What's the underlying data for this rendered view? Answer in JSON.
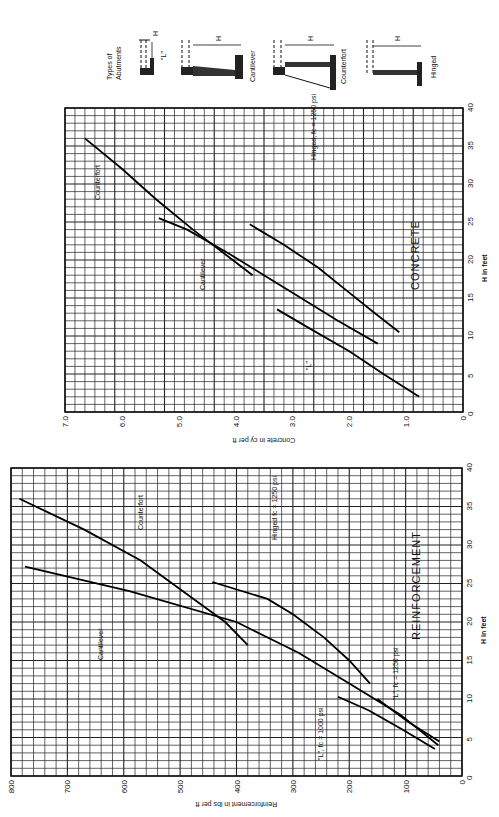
{
  "page": {
    "header_faint": "",
    "legend": {
      "title_line1": "Types of",
      "title_line2": "Abutments",
      "types": [
        {
          "key": "L",
          "label": "\"L\""
        },
        {
          "key": "cantilever",
          "label": "Cantilever"
        },
        {
          "key": "counterfort",
          "label": "Counterfort"
        },
        {
          "key": "hinged",
          "label": "Hinged"
        }
      ],
      "dimension_label": "H"
    }
  },
  "chart_data": [
    {
      "id": "concrete",
      "type": "line",
      "orientation": "rotated-90-ccw",
      "title": "CONCRETE",
      "xlabel": "H in feet",
      "ylabel": "Concrete in cy per ft",
      "xlim": [
        0,
        40
      ],
      "ylim": [
        0,
        7.0
      ],
      "xticks": [
        0,
        5,
        10,
        15,
        20,
        25,
        30,
        35,
        40
      ],
      "yticks": [
        0,
        1.0,
        2.0,
        3.0,
        4.0,
        5.0,
        6.0,
        7.0
      ],
      "ytick_labels": [
        "0",
        "1.0",
        "2.0",
        "3.0",
        "4.0",
        "5.0",
        "6.0",
        "7.0"
      ],
      "grid": true,
      "series": [
        {
          "name": "Counterfort",
          "label": "Counterfort",
          "points": [
            [
              18,
              3.7
            ],
            [
              20,
              4.05
            ],
            [
              24,
              4.75
            ],
            [
              28,
              5.4
            ],
            [
              32,
              6.0
            ],
            [
              36,
              6.65
            ]
          ]
        },
        {
          "name": "Cantilever",
          "label": "Cantilever",
          "points": [
            [
              9,
              1.5
            ],
            [
              12,
              2.2
            ],
            [
              15,
              2.85
            ],
            [
              18,
              3.5
            ],
            [
              21,
              4.15
            ],
            [
              24,
              4.85
            ],
            [
              25.5,
              5.35
            ]
          ]
        },
        {
          "name": "Hinged, fc = 1250 psi",
          "label": "Hinged, fc = 1250 psi",
          "points": [
            [
              10.5,
              1.12
            ],
            [
              13,
              1.55
            ],
            [
              16,
              2.05
            ],
            [
              19,
              2.55
            ],
            [
              22,
              3.15
            ],
            [
              24.7,
              3.75
            ]
          ]
        },
        {
          "name": "\"L\"",
          "label": "\"L\"",
          "points": [
            [
              2,
              0.77
            ],
            [
              5,
              1.4
            ],
            [
              8,
              2.0
            ],
            [
              11,
              2.7
            ],
            [
              13.5,
              3.27
            ]
          ]
        }
      ]
    },
    {
      "id": "reinforcement",
      "type": "line",
      "orientation": "rotated-90-ccw",
      "title": "REINFORCEMENT",
      "xlabel": "H in feet",
      "ylabel": "Reinforcement in lbs per ft",
      "xlim": [
        0,
        40
      ],
      "ylim": [
        0,
        800
      ],
      "xticks": [
        0,
        5,
        10,
        15,
        20,
        25,
        30,
        35,
        40
      ],
      "yticks": [
        0,
        100,
        200,
        300,
        400,
        500,
        600,
        700,
        800
      ],
      "ytick_labels": [
        "0",
        "100",
        "200",
        "300",
        "400",
        "500",
        "600",
        "700",
        "800"
      ],
      "grid": true,
      "series": [
        {
          "name": "Counterfort",
          "label": "Counterfort",
          "points": [
            [
              17,
              380
            ],
            [
              20,
              420
            ],
            [
              24,
              495
            ],
            [
              28,
              570
            ],
            [
              32,
              670
            ],
            [
              36,
              785
            ]
          ]
        },
        {
          "name": "Cantilever",
          "label": "Cantilever",
          "points": [
            [
              4,
              42
            ],
            [
              8,
              110
            ],
            [
              12,
              200
            ],
            [
              16,
              290
            ],
            [
              20,
              400
            ],
            [
              24,
              590
            ],
            [
              27.2,
              775
            ]
          ]
        },
        {
          "name": "Hinged fc = 1250 psi",
          "label": "Hinged fc = 1250 psi",
          "points": [
            [
              12,
              163
            ],
            [
              15,
              200
            ],
            [
              18,
              245
            ],
            [
              21,
              300
            ],
            [
              23,
              345
            ],
            [
              25.2,
              443
            ]
          ]
        },
        {
          "name": "\"L\", fc = 1250 psi",
          "label": "\"L\", fc = 1250 psi",
          "points": [
            [
              4.5,
              40
            ],
            [
              7,
              95
            ],
            [
              10,
              150
            ]
          ]
        },
        {
          "name": "\"L\", fc = 1000 psi",
          "label": "\"L\", fc = 1000 psi",
          "points": [
            [
              3.5,
              48
            ],
            [
              6,
              105
            ],
            [
              8.5,
              165
            ],
            [
              10.3,
              220
            ]
          ]
        }
      ]
    }
  ]
}
